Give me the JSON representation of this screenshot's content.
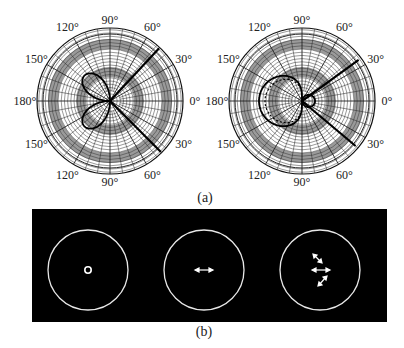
{
  "figure": {
    "panel_a": {
      "caption": "(a)",
      "plots": [
        {
          "name": "polar-left",
          "angle_labels": [
            "90°",
            "60°",
            "30°",
            "0°",
            "30°",
            "60°",
            "90°",
            "120°",
            "150°",
            "180°",
            "150°",
            "120°"
          ],
          "curve": "two-lobe dipole pattern on 180° side",
          "beam_lines": [
            "±40° rays"
          ]
        },
        {
          "name": "polar-right",
          "angle_labels": [
            "90°",
            "60°",
            "30°",
            "0°",
            "30°",
            "60°",
            "90°",
            "120°",
            "150°",
            "180°",
            "150°",
            "120°"
          ],
          "curve": "large lobe toward 180° with dotted inner contour, small lobe toward 0°",
          "beam_lines": [
            "±35° rays"
          ]
        }
      ]
    },
    "panel_b": {
      "caption": "(b)",
      "background": "#000000",
      "foreground": "#ffffff",
      "cells": [
        {
          "name": "circle-1",
          "content": "small ring at center"
        },
        {
          "name": "circle-2",
          "content": "horizontal double arrow"
        },
        {
          "name": "circle-3",
          "content": "three double arrows (diagonal, horizontal, diagonal)"
        }
      ]
    }
  }
}
